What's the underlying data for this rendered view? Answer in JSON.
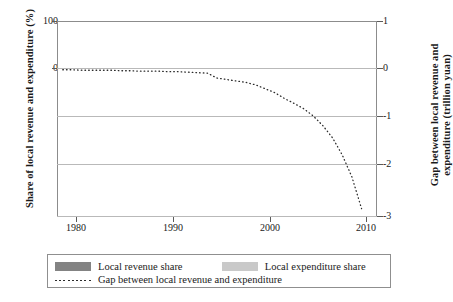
{
  "axes": {
    "left_title": "Share of local revenue and expenditure (%)",
    "right_title_line1": "Gap between local revenue and",
    "right_title_line2": "expenditure (trillion yuan)",
    "left_ticks": [
      "100",
      "0"
    ],
    "right_ticks": [
      "1",
      "0",
      "-1",
      "-2",
      "-3"
    ],
    "x_ticks": [
      "1980",
      "1990",
      "2000",
      "2010"
    ]
  },
  "legend": {
    "revenue_label": "Local revenue share",
    "expenditure_label": "Local expenditure share",
    "gap_label": "Gap between local revenue and expenditure"
  },
  "colors": {
    "revenue": "#838383",
    "expenditure": "#c9c9c9",
    "gap_line": "#2b2b2b",
    "grid": "#b9b9b9",
    "frame": "#8c8c8c"
  },
  "chart_data": {
    "type": "bar",
    "title": "",
    "xlabel": "",
    "ylabel": "Share of local revenue and expenditure (%)",
    "y2label": "Gap between local revenue and expenditure (trillion yuan)",
    "grid": true,
    "legend_position": "bottom",
    "xlim": [
      1977.4,
      2010.6
    ],
    "ylim": [
      -300,
      100
    ],
    "y2lim": [
      -3,
      1
    ],
    "categories": [
      1978,
      1979,
      1980,
      1981,
      1982,
      1983,
      1984,
      1985,
      1986,
      1987,
      1988,
      1989,
      1990,
      1991,
      1992,
      1993,
      1994,
      1995,
      1996,
      1997,
      1998,
      1999,
      2000,
      2001,
      2002,
      2003,
      2004,
      2005,
      2006,
      2007,
      2008,
      2009
    ],
    "series": [
      {
        "name": "Local revenue share",
        "axis": "left",
        "unit": "%",
        "values": [
          84.5,
          78.8,
          75.5,
          74.2,
          73.5,
          67.0,
          59.5,
          61.6,
          62.1,
          62.6,
          67.1,
          66.1,
          66.0,
          70.2,
          68.8,
          78.0,
          44.3,
          47.8,
          49.4,
          51.1,
          50.5,
          48.9,
          47.8,
          47.6,
          45.0,
          45.4,
          45.1,
          47.7,
          47.2,
          45.9,
          46.7,
          47.6
        ]
      },
      {
        "name": "Local expenditure share",
        "axis": "left",
        "unit": "%",
        "values": [
          52.6,
          51.1,
          45.7,
          45.0,
          53.0,
          53.9,
          52.5,
          60.3,
          62.1,
          62.6,
          66.1,
          68.5,
          67.4,
          67.8,
          68.7,
          71.7,
          69.7,
          70.8,
          72.9,
          72.6,
          71.1,
          68.5,
          65.3,
          69.5,
          69.3,
          69.9,
          72.3,
          74.1,
          75.3,
          77.0,
          78.7,
          80.0
        ]
      },
      {
        "name": "Gap between local revenue and expenditure",
        "axis": "right",
        "unit": "trillion yuan",
        "values": [
          0.0,
          0.0,
          -0.01,
          -0.01,
          -0.01,
          -0.01,
          -0.02,
          -0.02,
          -0.03,
          -0.03,
          -0.03,
          -0.04,
          -0.04,
          -0.05,
          -0.06,
          -0.07,
          -0.17,
          -0.2,
          -0.23,
          -0.26,
          -0.31,
          -0.39,
          -0.47,
          -0.59,
          -0.69,
          -0.8,
          -0.95,
          -1.15,
          -1.4,
          -1.75,
          -2.2,
          -2.85
        ]
      }
    ]
  }
}
